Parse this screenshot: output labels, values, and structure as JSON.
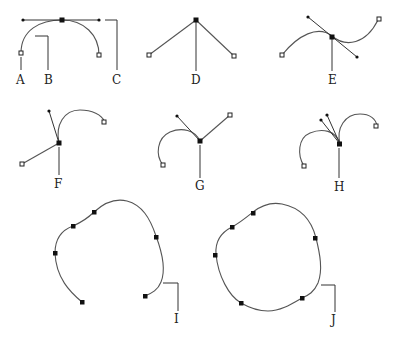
{
  "diagram": {
    "labels": {
      "A": "A",
      "B": "B",
      "C": "C",
      "D": "D",
      "E": "E",
      "F": "F",
      "G": "G",
      "H": "H",
      "I": "I",
      "J": "J"
    },
    "figures": [
      {
        "id": "A-B-C",
        "description": "Smooth curve with anchor point (A), direction line (B) and direction point (C)"
      },
      {
        "id": "D",
        "description": "Corner point joining two straight segments"
      },
      {
        "id": "E",
        "description": "Smooth point with collinear direction handles"
      },
      {
        "id": "F",
        "description": "Corner point joining straight line and curve"
      },
      {
        "id": "G",
        "description": "Corner point joining curve and straight line"
      },
      {
        "id": "H",
        "description": "Corner point joining two curves with independent handles"
      },
      {
        "id": "I",
        "description": "Open path with multiple anchor points"
      },
      {
        "id": "J",
        "description": "Closed path with multiple anchor points"
      }
    ],
    "colors": {
      "stroke": "#555555",
      "anchor_fill": "#111111",
      "background": "#ffffff"
    }
  }
}
